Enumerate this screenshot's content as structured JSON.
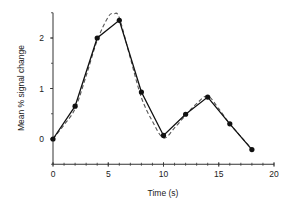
{
  "chart_data": {
    "type": "line",
    "title": "",
    "xlabel": "Time (s)",
    "ylabel": "Mean % signal change",
    "xlim": [
      0,
      20
    ],
    "ylim": [
      -0.5,
      2.5
    ],
    "x_ticks": [
      0,
      5,
      10,
      15,
      20
    ],
    "x_tick_labels": [
      "0",
      "5",
      "10",
      "15",
      "20"
    ],
    "x_minor_step": 1,
    "y_ticks": [
      0,
      1,
      2
    ],
    "y_tick_labels": [
      "0",
      "1",
      "2"
    ],
    "y_minor_step": 0.5,
    "grid": false,
    "legend": null,
    "series": [
      {
        "name": "measured",
        "style": "solid-with-markers",
        "color": "#111111",
        "x": [
          0,
          2,
          4,
          6,
          8,
          10,
          12,
          14,
          16,
          18
        ],
        "values": [
          0.0,
          0.65,
          2.0,
          2.35,
          0.93,
          0.07,
          0.49,
          0.83,
          0.3,
          -0.21
        ]
      },
      {
        "name": "fit",
        "style": "dashed",
        "color": "#555555",
        "x": [
          0,
          1,
          2,
          3,
          4,
          5,
          5.5,
          6,
          7,
          8,
          9,
          10,
          11,
          12,
          13,
          14,
          15,
          16,
          17,
          18
        ],
        "values": [
          0.0,
          0.28,
          0.6,
          1.25,
          1.95,
          2.42,
          2.48,
          2.4,
          1.6,
          0.82,
          0.35,
          0.02,
          0.22,
          0.47,
          0.7,
          0.85,
          0.6,
          0.3,
          0.05,
          -0.2
        ]
      }
    ]
  }
}
